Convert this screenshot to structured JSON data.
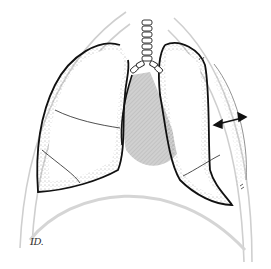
{
  "figure": {
    "signature": "ID.",
    "colors": {
      "outline": "#111111",
      "stipple": "#555555",
      "heart_fill": "#c8c8c8",
      "chest_wall": "#cfcfcf",
      "background": "#ffffff"
    },
    "annotations": {
      "measurement_arrow": "double-headed arrow indicating gap between collapsed left lung and chest wall"
    }
  }
}
